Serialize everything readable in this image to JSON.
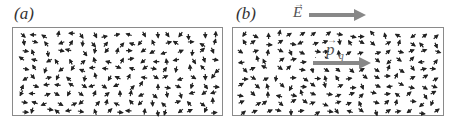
{
  "panels": [
    {
      "id": "a",
      "label": "(a)",
      "description": "randomly oriented dipoles, no field"
    },
    {
      "id": "b",
      "label": "(b)",
      "description": "dipoles partially aligned with applied field"
    }
  ],
  "field_label": "E",
  "polarization_label": "p",
  "polarization_subscript": "q",
  "colors": {
    "dipole": "#222222",
    "box_border": "#8a8a8a",
    "big_arrow": "#888888"
  }
}
